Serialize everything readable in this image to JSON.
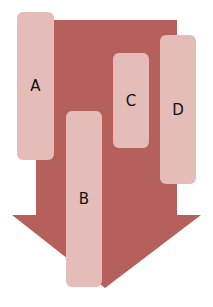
{
  "diagram": {
    "type": "down-arrow-with-labeled-bars",
    "colors": {
      "arrow": "#b5605a",
      "box": "#e5bdb8",
      "text": "#111111",
      "background": "#ffffff"
    },
    "boxes": [
      {
        "label": "A",
        "x": 17,
        "y": 12,
        "w": 37,
        "h": 148
      },
      {
        "label": "B",
        "x": 66,
        "y": 111,
        "w": 36,
        "h": 176
      },
      {
        "label": "C",
        "x": 113,
        "y": 53,
        "w": 36,
        "h": 95
      },
      {
        "label": "D",
        "x": 160,
        "y": 35,
        "w": 36,
        "h": 149
      }
    ]
  }
}
